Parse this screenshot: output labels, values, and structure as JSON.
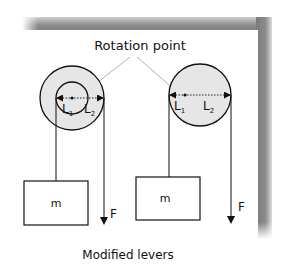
{
  "title": "Rotation point",
  "caption": "Modified levers",
  "colors": {
    "background": "#ffffff",
    "panel": "#ffffff",
    "shadow": "#8a8a8a",
    "pulley_fill": "#e6e6e6",
    "stroke": "#111111",
    "pointer_line": "#a8a8a8"
  },
  "left_lever": {
    "mass_label": "m",
    "force_label": "F",
    "l1_label": "L",
    "l1_sub": "1",
    "l2_label": "L",
    "l2_sub": "2"
  },
  "right_lever": {
    "mass_label": "m",
    "force_label": "F",
    "l1_label": "L",
    "l1_sub": "1",
    "l2_label": "L",
    "l2_sub": "2"
  }
}
